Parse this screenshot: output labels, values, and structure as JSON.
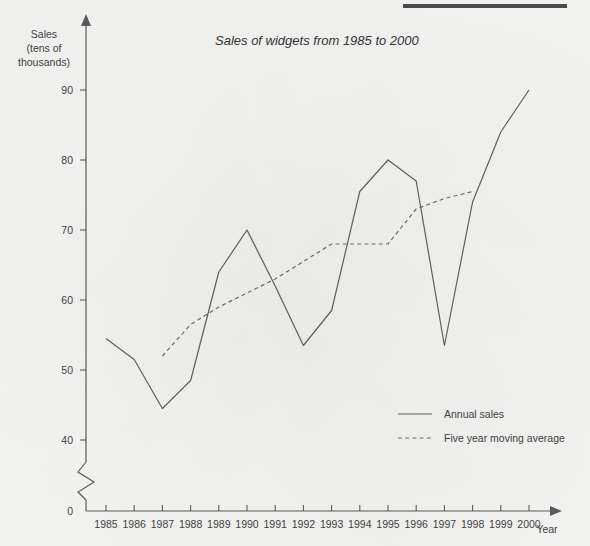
{
  "page": {
    "background_color": "#f4f4f2",
    "top_rule_color": "#4b4b4b"
  },
  "chart_data": {
    "type": "line",
    "title": "Sales of widgets from 1985 to 2000",
    "xlabel": "Year",
    "ylabel": "Sales\n(tens of\nthousands)",
    "ylabel_lines": [
      "Sales",
      "(tens of",
      "thousands)"
    ],
    "axis_label_x": "Year",
    "grid": false,
    "axis_break": true,
    "axis_break_note": "y-axis broken between 0 and 40",
    "x": [
      1985,
      1986,
      1987,
      1988,
      1989,
      1990,
      1991,
      1992,
      1993,
      1994,
      1995,
      1996,
      1997,
      1998,
      1999,
      2000
    ],
    "xtick_labels": [
      "1985",
      "1986",
      "1987",
      "1988",
      "1989",
      "1990",
      "1991",
      "1992",
      "1993",
      "1994",
      "1995",
      "1996",
      "1997",
      "1998",
      "1999",
      "2000"
    ],
    "ytick_labels": [
      "0",
      "40",
      "50",
      "60",
      "70",
      "80",
      "90"
    ],
    "yticks": [
      0,
      40,
      50,
      60,
      70,
      80,
      90
    ],
    "ylim": [
      0,
      95
    ],
    "xlim": [
      1984.5,
      2000.8
    ],
    "legend_position": "inside-lower-right",
    "series": [
      {
        "name": "Annual sales",
        "style": "solid",
        "color": "#5e5e5e",
        "x": [
          1985,
          1986,
          1987,
          1988,
          1989,
          1990,
          1991,
          1992,
          1993,
          1994,
          1995,
          1996,
          1997,
          1998,
          1999,
          2000
        ],
        "values": [
          54.5,
          51.5,
          44.5,
          48.5,
          64,
          70,
          62,
          53.5,
          58.5,
          75.5,
          80,
          77,
          53.5,
          74,
          84,
          90
        ]
      },
      {
        "name": "Five year moving average",
        "style": "dashed",
        "color": "#6a6a6a",
        "x": [
          1987,
          1988,
          1989,
          1990,
          1991,
          1992,
          1993,
          1994,
          1995,
          1996,
          1997,
          1998
        ],
        "values": [
          52,
          56.5,
          59,
          61,
          63,
          65.5,
          68,
          68,
          68,
          73,
          74.5,
          75.5
        ]
      }
    ]
  },
  "legend": {
    "items": [
      {
        "label": "Annual sales",
        "style": "solid"
      },
      {
        "label": "Five year moving average",
        "style": "dashed"
      }
    ]
  }
}
